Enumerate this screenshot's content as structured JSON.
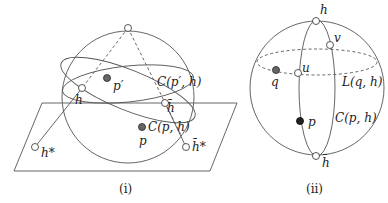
{
  "figure_i": {
    "caption": "(i)",
    "labels": {
      "p_prime": "p′",
      "h": "h",
      "C_p_prime_h": "C(p′, h)",
      "h_bar": "h̄",
      "C_p_h": "C(p, h)",
      "p": "p",
      "h_star": "h*",
      "h_bar_star": "h̄*"
    }
  },
  "figure_ii": {
    "caption": "(ii)",
    "labels": {
      "h": "h",
      "v": "v",
      "u": "u",
      "q": "q",
      "L_q_h": "L(q, h)",
      "p": "p",
      "C_p_h": "C(p, h)",
      "h_bar": "h̄"
    }
  }
}
